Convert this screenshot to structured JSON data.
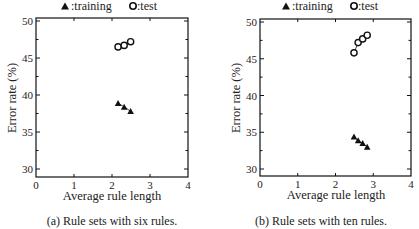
{
  "chart_data": [
    {
      "type": "line",
      "id": "a",
      "caption": "(a) Rule sets with six rules.",
      "xlabel": "Average rule length",
      "ylabel": "Error rate (%)",
      "xlim": [
        0,
        4
      ],
      "ylim": [
        29,
        50.5
      ],
      "xticks": [
        "0",
        "1",
        "2",
        "3",
        "4"
      ],
      "yticks": [
        "30",
        "35",
        "40",
        "45",
        "50"
      ],
      "xtick_values": [
        0,
        1,
        2,
        3,
        4
      ],
      "ytick_values": [
        30,
        35,
        40,
        45,
        50
      ],
      "grid": false,
      "legend": {
        "position": "top-center",
        "entries": [
          {
            "marker": "filled-triangle",
            "label": ":training"
          },
          {
            "marker": "open-circle",
            "label": ":test"
          }
        ]
      },
      "series": [
        {
          "name": "training",
          "marker": "filled-triangle",
          "x": [
            2.16,
            2.32,
            2.49
          ],
          "y": [
            38.9,
            38.4,
            37.8
          ]
        },
        {
          "name": "test",
          "marker": "open-circle",
          "x": [
            2.16,
            2.32,
            2.49
          ],
          "y": [
            46.5,
            46.7,
            47.2
          ]
        }
      ]
    },
    {
      "type": "line",
      "id": "b",
      "caption": "(b) Rule sets with ten rules.",
      "xlabel": "Average rule length",
      "ylabel": "Error rate (%)",
      "xlim": [
        0,
        4
      ],
      "ylim": [
        29,
        50.5
      ],
      "xticks": [
        "0",
        "1",
        "2",
        "3",
        "4"
      ],
      "yticks": [
        "30",
        "35",
        "40",
        "45",
        "50"
      ],
      "xtick_values": [
        0,
        1,
        2,
        3,
        4
      ],
      "ytick_values": [
        30,
        35,
        40,
        45,
        50
      ],
      "grid": false,
      "legend": {
        "position": "top-center",
        "entries": [
          {
            "marker": "filled-triangle",
            "label": ":training"
          },
          {
            "marker": "open-circle",
            "label": ":test"
          }
        ]
      },
      "series": [
        {
          "name": "training",
          "marker": "filled-triangle",
          "x": [
            2.49,
            2.6,
            2.72,
            2.84
          ],
          "y": [
            34.4,
            33.9,
            33.5,
            33.0
          ]
        },
        {
          "name": "test",
          "marker": "open-circle",
          "x": [
            2.49,
            2.6,
            2.72,
            2.84
          ],
          "y": [
            45.8,
            47.2,
            47.7,
            48.2
          ]
        }
      ]
    }
  ]
}
